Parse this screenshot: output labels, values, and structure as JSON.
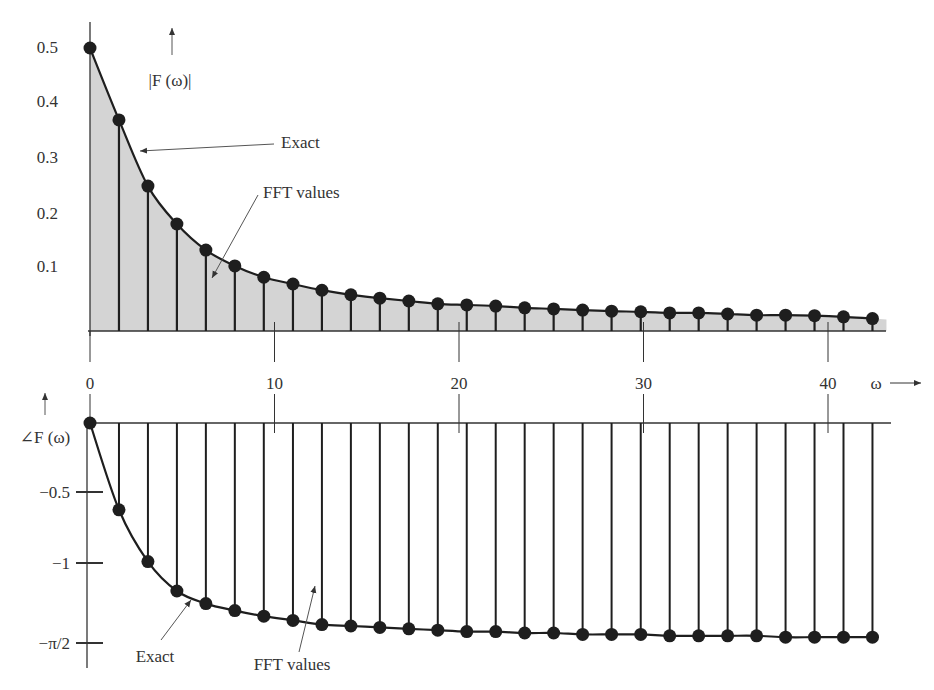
{
  "figure": {
    "colors": {
      "ink": "#1e1e1e",
      "fill": "#d4d4d4",
      "annotation": "#555555",
      "background": "#ffffff"
    },
    "x_axis": {
      "symbol": "ω",
      "ticks": [
        {
          "value": 0,
          "label": "0"
        },
        {
          "value": 10,
          "label": "10"
        },
        {
          "value": 20,
          "label": "20"
        },
        {
          "value": 30,
          "label": "30"
        },
        {
          "value": 40,
          "label": "40"
        }
      ]
    },
    "magnitude_plot": {
      "ylabel": "|F (ω)|",
      "yticks": [
        "0.5",
        "0.4",
        "0.3",
        "0.2",
        "0.1"
      ],
      "annotations": {
        "exact": "Exact",
        "fft": "FFT values"
      }
    },
    "phase_plot": {
      "ylabel": "∠F (ω)",
      "yticks": [
        "−0.5",
        "−1",
        "−π/2"
      ],
      "annotations": {
        "exact": "Exact",
        "fft": "FFT values"
      }
    }
  },
  "chart_data": [
    {
      "type": "line",
      "title": "",
      "subtitle": "Magnitude spectrum: exact curve (shaded) and FFT values (stems with dots)",
      "xlabel": "ω",
      "ylabel": "|F (ω)|",
      "xlim": [
        0,
        45
      ],
      "ylim": [
        0,
        0.5
      ],
      "xticks": [
        0,
        10,
        20,
        30,
        40
      ],
      "yticks": [
        0.1,
        0.2,
        0.3,
        0.4,
        0.5
      ],
      "grid": false,
      "legend": "annotated arrows: Exact, FFT values",
      "x": [
        0,
        1.57,
        3.14,
        4.71,
        6.28,
        7.85,
        9.42,
        11.0,
        12.57,
        14.14,
        15.71,
        17.28,
        18.85,
        20.42,
        21.99,
        23.56,
        25.13,
        26.7,
        28.27,
        29.85,
        31.42,
        32.99,
        34.56,
        36.13,
        37.7,
        39.27,
        40.84,
        42.41
      ],
      "series": [
        {
          "name": "FFT values",
          "style": "stem",
          "values": [
            0.5,
            0.373,
            0.256,
            0.189,
            0.143,
            0.115,
            0.095,
            0.083,
            0.072,
            0.064,
            0.058,
            0.053,
            0.048,
            0.046,
            0.044,
            0.041,
            0.039,
            0.037,
            0.035,
            0.034,
            0.032,
            0.032,
            0.03,
            0.028,
            0.028,
            0.027,
            0.025,
            0.022
          ]
        },
        {
          "name": "Exact",
          "style": "line+shaded",
          "values": [
            0.5,
            0.373,
            0.256,
            0.189,
            0.143,
            0.115,
            0.095,
            0.083,
            0.072,
            0.064,
            0.058,
            0.053,
            0.048,
            0.046,
            0.044,
            0.041,
            0.039,
            0.037,
            0.035,
            0.034,
            0.032,
            0.032,
            0.03,
            0.028,
            0.028,
            0.027,
            0.025,
            0.022
          ]
        }
      ]
    },
    {
      "type": "line",
      "title": "",
      "subtitle": "Phase spectrum: exact curve and FFT values (stems with dots)",
      "xlabel": "ω",
      "ylabel": "∠F (ω)",
      "xlim": [
        0,
        45
      ],
      "ylim": [
        -1.5708,
        0
      ],
      "xticks": [
        0,
        10,
        20,
        30,
        40
      ],
      "yticks": [
        -0.5,
        -1,
        -1.5708
      ],
      "ytick_labels": [
        "−0.5",
        "−1",
        "−π/2"
      ],
      "grid": false,
      "legend": "annotated arrows: Exact, FFT values",
      "x": [
        0,
        1.57,
        3.14,
        4.71,
        6.28,
        7.85,
        9.42,
        11.0,
        12.57,
        14.14,
        15.71,
        17.28,
        18.85,
        20.42,
        21.99,
        23.56,
        25.13,
        26.7,
        28.27,
        29.85,
        31.42,
        32.99,
        34.56,
        36.13,
        37.7,
        39.27,
        40.84,
        42.41
      ],
      "series": [
        {
          "name": "FFT values",
          "style": "stem",
          "values": [
            0,
            -0.62,
            -0.99,
            -1.2,
            -1.29,
            -1.34,
            -1.38,
            -1.41,
            -1.44,
            -1.45,
            -1.46,
            -1.47,
            -1.48,
            -1.49,
            -1.49,
            -1.5,
            -1.5,
            -1.51,
            -1.51,
            -1.51,
            -1.52,
            -1.52,
            -1.52,
            -1.52,
            -1.53,
            -1.53,
            -1.53,
            -1.53
          ]
        },
        {
          "name": "Exact",
          "style": "line",
          "values": [
            0,
            -0.62,
            -0.99,
            -1.2,
            -1.29,
            -1.34,
            -1.38,
            -1.41,
            -1.44,
            -1.45,
            -1.46,
            -1.47,
            -1.48,
            -1.49,
            -1.49,
            -1.5,
            -1.5,
            -1.51,
            -1.51,
            -1.51,
            -1.52,
            -1.52,
            -1.52,
            -1.52,
            -1.53,
            -1.53,
            -1.53,
            -1.53
          ]
        }
      ]
    }
  ]
}
